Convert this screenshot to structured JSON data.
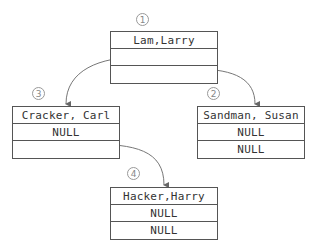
{
  "diagram": {
    "type": "binary-tree-linked-list",
    "nodes": [
      {
        "id": "n1",
        "order": "1",
        "name": "Lam,Larry",
        "left": "",
        "right": ""
      },
      {
        "id": "n2",
        "order": "2",
        "name": "Sandman, Susan",
        "left": "NULL",
        "right": "NULL"
      },
      {
        "id": "n3",
        "order": "3",
        "name": "Cracker, Carl",
        "left": "NULL",
        "right": ""
      },
      {
        "id": "n4",
        "order": "4",
        "name": "Hacker,Harry",
        "left": "NULL",
        "right": "NULL"
      }
    ],
    "edges": [
      {
        "from": "Lam,Larry.left",
        "to": "Cracker, Carl"
      },
      {
        "from": "Lam,Larry.right",
        "to": "Sandman, Susan"
      },
      {
        "from": "Cracker, Carl.right",
        "to": "Hacker,Harry"
      }
    ]
  }
}
